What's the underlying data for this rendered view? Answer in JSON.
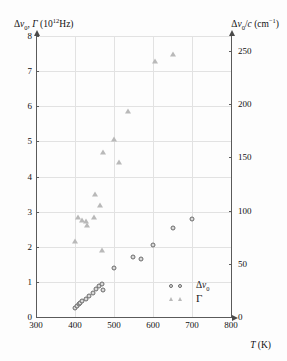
{
  "chart_data": {
    "type": "scatter",
    "title": "",
    "xlabel": "T (K)",
    "ylabel": "Δν0, Γ (10^12 Hz)",
    "y2label": "Δν0/c (cm^-1)",
    "xlim": [
      300,
      800
    ],
    "ylim": [
      0,
      8
    ],
    "y2lim": [
      0,
      264
    ],
    "xticks": [
      300,
      400,
      500,
      600,
      700,
      800
    ],
    "yticks": [
      0,
      1,
      2,
      3,
      4,
      5,
      6,
      7,
      8
    ],
    "y2ticks": [
      0,
      50,
      100,
      150,
      200,
      250
    ],
    "grid": true,
    "legend_position": "inside-lower-right",
    "series": [
      {
        "name": "Δν0",
        "marker": "circle",
        "points": [
          [
            399,
            0.26
          ],
          [
            404,
            0.31
          ],
          [
            409,
            0.36
          ],
          [
            414,
            0.4
          ],
          [
            418,
            0.45
          ],
          [
            427,
            0.51
          ],
          [
            436,
            0.6
          ],
          [
            445,
            0.69
          ],
          [
            455,
            0.79
          ],
          [
            462,
            0.87
          ],
          [
            470,
            0.95
          ],
          [
            473,
            0.76
          ],
          [
            501,
            1.4
          ],
          [
            549,
            1.71
          ],
          [
            570,
            1.64
          ],
          [
            601,
            2.05
          ],
          [
            650,
            2.52
          ],
          [
            700,
            2.8
          ]
        ]
      },
      {
        "name": "Γ",
        "marker": "triangle",
        "points": [
          [
            401,
            2.17
          ],
          [
            407,
            2.85
          ],
          [
            418,
            2.77
          ],
          [
            427,
            2.73
          ],
          [
            431,
            2.62
          ],
          [
            448,
            2.85
          ],
          [
            452,
            3.51
          ],
          [
            464,
            3.18
          ],
          [
            470,
            1.92
          ],
          [
            473,
            4.7
          ],
          [
            501,
            5.06
          ],
          [
            513,
            4.41
          ],
          [
            536,
            5.86
          ],
          [
            606,
            7.3
          ],
          [
            651,
            7.5
          ]
        ]
      }
    ]
  },
  "axes": {
    "left": {
      "title_prefix": "Δ",
      "title_nu": "ν",
      "title_sub": "0",
      "title_comma": ", ",
      "title_gamma": "Γ",
      "title_unit_open": " (10",
      "title_unit_exp": "12",
      "title_unit_close": "Hz)",
      "ticks": [
        "8",
        "7",
        "6",
        "5",
        "4",
        "3",
        "2",
        "1",
        "0"
      ]
    },
    "right": {
      "title_prefix": "Δ",
      "title_nu": "ν",
      "title_sub": "0",
      "title_div": "/",
      "title_c": "c",
      "title_unit_open": " (cm",
      "title_unit_exp": "−1",
      "title_unit_close": ")",
      "ticks": [
        "250",
        "200",
        "150",
        "100",
        "50",
        "0"
      ]
    },
    "bottom": {
      "title_var": "T",
      "title_unit": " (K)",
      "ticks": [
        "300",
        "400",
        "500",
        "600",
        "700",
        "800"
      ]
    }
  },
  "legend": {
    "entries": [
      {
        "symbol": "circle",
        "label_prefix": "Δ",
        "label_nu": "ν",
        "label_sub": "0"
      },
      {
        "symbol": "triangle",
        "label_gamma": "Γ"
      }
    ]
  }
}
